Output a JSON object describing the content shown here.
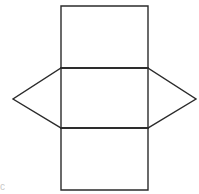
{
  "canvas": {
    "width": 199,
    "height": 194,
    "background_color": "#ffffff"
  },
  "figure": {
    "kind": "geometry-net-diagram",
    "stroke_color": "#2b2b2b",
    "stroke_width": 1.4,
    "fill_color": "none"
  },
  "geometry": {
    "column_left_x": 61,
    "column_right_x": 148,
    "square_width": 87,
    "row_y": [
      6,
      68,
      128,
      190
    ],
    "left_apex": {
      "x": 13,
      "y": 99
    },
    "right_apex": {
      "x": 196,
      "y": 99
    },
    "midline_y": 99
  },
  "shapes": {
    "top_square": {
      "name": "top-square",
      "points": "61,6 148,6 148,68 61,68"
    },
    "middle_square": {
      "name": "middle-square",
      "points": "61,68 148,68 148,128 61,128"
    },
    "bottom_square": {
      "name": "bottom-square",
      "points": "61,128 148,128 148,190 61,190"
    },
    "left_triangle": {
      "name": "left-triangle",
      "points": "61,68 13,99 61,128"
    },
    "right_triangle": {
      "name": "right-triangle",
      "points": "148,68 196,99 148,128"
    }
  },
  "edges": {
    "top_square_outline": "M61,6 L148,6 L148,68 L61,68 Z",
    "middle_square_outline": "M61,68 L148,68 L148,128 L61,128 Z",
    "bottom_square_outline": "M61,128 L148,128 L148,190 L61,190 Z",
    "left_triangle_outline": "M61,68 L13,99 L61,128",
    "right_triangle_outline": "M148,68 L196,99 L148,128",
    "fold_line_upper": "M61,68 L148,68",
    "fold_line_lower": "M61,128 L148,128"
  },
  "artifact": {
    "label": "c",
    "note": "faint clipped glyph in lower-left corner"
  }
}
